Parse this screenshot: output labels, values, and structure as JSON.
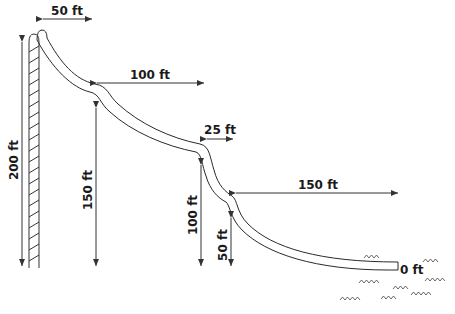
{
  "diagram": {
    "colors": {
      "line": "#333333",
      "text": "#1a1a1a",
      "background": "#ffffff"
    },
    "horizontal_labels": [
      {
        "id": "h1",
        "text": "50 ft"
      },
      {
        "id": "h2",
        "text": "100 ft"
      },
      {
        "id": "h3",
        "text": "25 ft"
      },
      {
        "id": "h4",
        "text": "150 ft"
      }
    ],
    "vertical_labels": [
      {
        "id": "v1",
        "text": "200 ft"
      },
      {
        "id": "v2",
        "text": "150 ft"
      },
      {
        "id": "v3",
        "text": "100 ft"
      },
      {
        "id": "v4",
        "text": "50 ft"
      }
    ],
    "end_label": "0 ft",
    "icons": [
      "ladder-icon",
      "water-waves-icon"
    ]
  }
}
